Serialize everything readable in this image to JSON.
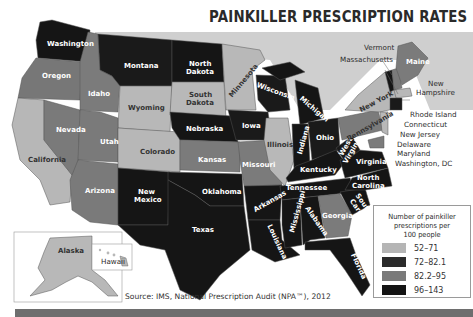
{
  "title": "PAINKILLER PRESCRIPTION RATES",
  "legend": {
    "title_line1": "Number of painkiller",
    "title_line2": "prescriptions per",
    "title_line3": "100 people",
    "items": [
      {
        "label": "52–71",
        "color": "#b5b5b5"
      },
      {
        "label": "72–82.1",
        "color": "#2b2b2b"
      },
      {
        "label": "82.2–95",
        "color": "#7a7a7a"
      },
      {
        "label": "96–143",
        "color": "#141414"
      }
    ]
  },
  "source": "Source: IMS, National Prescription Audit (NPA™), 2012",
  "states": {
    "washington": "Washington",
    "oregon": "Oregon",
    "california": "California",
    "idaho": "Idaho",
    "nevada": "Nevada",
    "montana": "Montana",
    "wyoming": "Wyoming",
    "utah": "Utah",
    "arizona": "Arizona",
    "colorado": "Colorado",
    "new_mexico_1": "New",
    "new_mexico_2": "Mexico",
    "north_dakota_1": "North",
    "north_dakota_2": "Dakota",
    "south_dakota_1": "South",
    "south_dakota_2": "Dakota",
    "nebraska": "Nebraska",
    "kansas": "Kansas",
    "oklahoma": "Oklahoma",
    "texas": "Texas",
    "minnesota": "Minnesota",
    "iowa": "Iowa",
    "missouri": "Missouri",
    "arkansas": "Arkansas",
    "louisiana": "Louisiana",
    "wisconsin": "Wisconsin",
    "illinois": "Illinois",
    "michigan": "Michigan",
    "indiana": "Indiana",
    "ohio": "Ohio",
    "kentucky": "Kentucky",
    "tennessee": "Tennessee",
    "mississippi": "Mississippi",
    "alabama": "Alabama",
    "georgia": "Georgia",
    "florida": "Florida",
    "south_carolina_1": "South",
    "south_carolina_2": "Carolina",
    "north_carolina_1": "North",
    "north_carolina_2": "Carolina",
    "virginia": "Virginia",
    "west_virginia_1": "West",
    "west_virginia_2": "Virginia",
    "pennsylvania": "Pennsylvania",
    "new_york": "New York",
    "maine": "Maine",
    "alaska": "Alaska",
    "hawaii": "Hawaii"
  },
  "callouts": {
    "vermont": "Vermont",
    "massachusetts": "Massachusetts",
    "new_hampshire_1": "New",
    "new_hampshire_2": "Hampshire",
    "rhode_island": "Rhode Island",
    "connecticut": "Connecticut",
    "new_jersey": "New Jersey",
    "delaware": "Delaware",
    "maryland": "Maryland",
    "washington_dc": "Washington, DC"
  }
}
